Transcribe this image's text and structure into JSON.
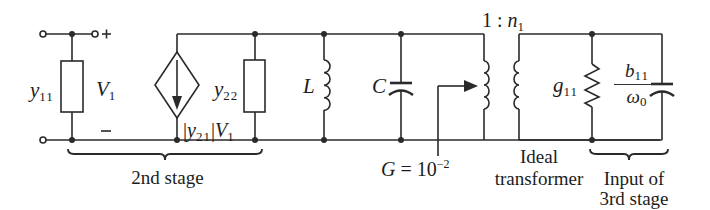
{
  "diagram": {
    "type": "circuit-schematic",
    "title": "",
    "components": {
      "input_admittance": {
        "symbol": "y",
        "sub": "11"
      },
      "input_voltage": {
        "symbol": "V",
        "sub": "1",
        "plus": "+",
        "minus": "−"
      },
      "dependent_source": {
        "prefix": "|",
        "symbol": "y",
        "sub": "21",
        "mid": "|",
        "symbol2": "V",
        "sub2": "1"
      },
      "output_admittance": {
        "symbol": "y",
        "sub": "22"
      },
      "inductor": {
        "symbol": "L"
      },
      "capacitor": {
        "symbol": "C"
      },
      "tap_conductance": {
        "text": "G = 10",
        "exp": "−2"
      },
      "transformer_ratio": {
        "text": "1 : ",
        "symbol": "n",
        "sub": "1"
      },
      "load_conductance": {
        "symbol": "g",
        "sub": "11"
      },
      "load_capacitance": {
        "num_symbol": "b",
        "num_sub": "11",
        "den_symbol": "ω",
        "den_sub": "0"
      }
    },
    "captions": {
      "second_stage": "2nd stage",
      "ideal_transformer_line1": "Ideal",
      "ideal_transformer_line2": "transformer",
      "third_stage_line1": "Input of",
      "third_stage_line2": "3rd stage"
    },
    "colors": {
      "line": "#2a2a2a",
      "background": "#ffffff"
    }
  }
}
